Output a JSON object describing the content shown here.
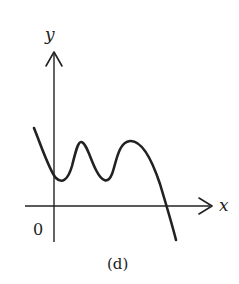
{
  "figure": {
    "caption": "(d)",
    "axes": {
      "x_label": "x",
      "y_label": "y",
      "origin_label": "0"
    },
    "colors": {
      "ink": "#222222",
      "background": "#ffffff"
    },
    "curve": {
      "description": "Polynomial-like curve: starts high left of y-axis, dips to local min just right of y-axis, rises to local max, dips to second local min, rises to higher local max, then falls crossing the positive x-axis and continuing downward",
      "features": [
        {
          "type": "start",
          "position": "left of y-axis, above x-axis"
        },
        {
          "type": "local_min",
          "position": "just right of y-axis"
        },
        {
          "type": "local_max",
          "position": "first peak"
        },
        {
          "type": "local_min",
          "position": "second trough"
        },
        {
          "type": "local_max",
          "position": "second peak"
        },
        {
          "type": "x_intercept",
          "position": "positive x"
        },
        {
          "type": "end",
          "position": "below x-axis"
        }
      ]
    }
  }
}
